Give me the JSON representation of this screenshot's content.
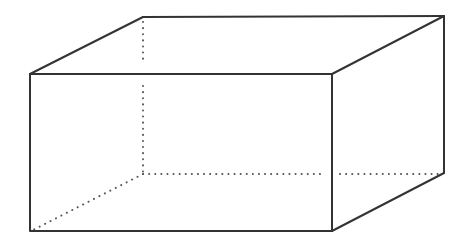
{
  "diagram": {
    "type": "cuboid-wireframe",
    "colors": {
      "background": "#ffffff",
      "edge": "#333333",
      "hidden_edge": "#555555"
    },
    "vertices": {
      "front_top_left": [
        30,
        74
      ],
      "front_top_right": [
        332,
        74
      ],
      "front_bottom_right": [
        332,
        231
      ],
      "front_bottom_left": [
        30,
        231
      ],
      "back_top_left": [
        143,
        17
      ],
      "back_top_right": [
        444,
        16
      ],
      "back_bottom_right": [
        444,
        152
      ],
      "back_bottom_left": [
        143,
        174
      ]
    },
    "visible_edges": 9,
    "hidden_edges": 3
  }
}
